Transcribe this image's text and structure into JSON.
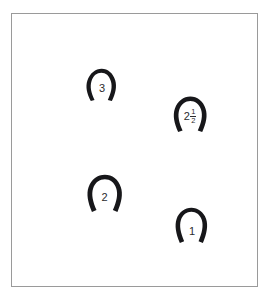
{
  "figure": {
    "type": "horseshoe-diagram",
    "background_color": "#ffffff",
    "frame": {
      "border_color": "#9a9a9a",
      "fill_color": "#ffffff"
    },
    "shape_color": "#17171a",
    "label_color": "#2b2b2e",
    "items": [
      {
        "id": "shoe-3",
        "shape": "horseshoe",
        "label": "3",
        "label_kind": "whole",
        "whole": "3",
        "numerator": "",
        "denominator": "",
        "position": {
          "x": 71,
          "y": 53,
          "width": 36,
          "height": 34
        }
      },
      {
        "id": "shoe-2-half",
        "shape": "horseshoe",
        "label": "2 1/2",
        "label_kind": "mixed-fraction",
        "whole": "2",
        "numerator": "1",
        "denominator": "2",
        "position": {
          "x": 159,
          "y": 81,
          "width": 38,
          "height": 37
        }
      },
      {
        "id": "shoe-2",
        "shape": "horseshoe",
        "label": "2",
        "label_kind": "whole",
        "whole": "2",
        "numerator": "",
        "denominator": "",
        "position": {
          "x": 73,
          "y": 160,
          "width": 39,
          "height": 38
        }
      },
      {
        "id": "shoe-1",
        "shape": "horseshoe",
        "label": "1",
        "label_kind": "whole",
        "whole": "1",
        "numerator": "",
        "denominator": "",
        "position": {
          "x": 161,
          "y": 191,
          "width": 36,
          "height": 40
        }
      }
    ]
  }
}
